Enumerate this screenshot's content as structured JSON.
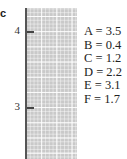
{
  "panel_label": "c",
  "axis": {
    "ticks": [
      {
        "value": 4,
        "label": "4"
      },
      {
        "value": 3,
        "label": "3"
      }
    ],
    "range": [
      2.33,
      4.3
    ]
  },
  "values": [
    {
      "name": "A",
      "value": 3.5,
      "text": "A = 3.5"
    },
    {
      "name": "B",
      "value": 0.4,
      "text": "B = 0.4"
    },
    {
      "name": "C",
      "value": 1.2,
      "text": "C = 1.2"
    },
    {
      "name": "D",
      "value": 2.2,
      "text": "D = 2.2"
    },
    {
      "name": "E",
      "value": 3.1,
      "text": "E = 3.1"
    },
    {
      "name": "F",
      "value": 1.7,
      "text": "F = 1.7"
    }
  ],
  "colors": {
    "grid": "#c9c9c9",
    "axis": "#555555",
    "text": "#222222"
  }
}
